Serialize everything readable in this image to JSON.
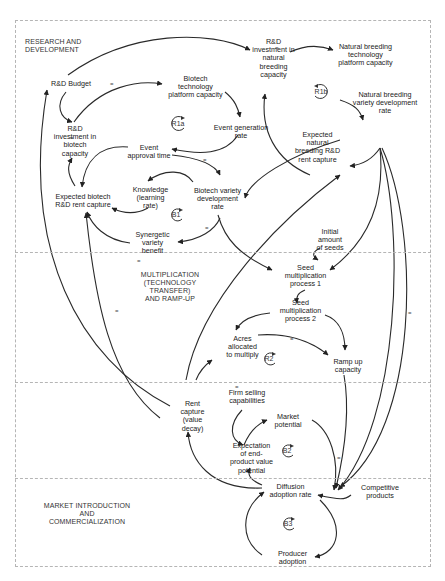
{
  "sections": [
    {
      "id": "rd",
      "label": "RESEARCH AND\nDEVELOPMENT"
    },
    {
      "id": "mult",
      "label": "MULTIPLICATION\n(TECHNOLOGY\nTRANSFER)\nAND RAMP-UP"
    },
    {
      "id": "market",
      "label": "MARKET INTRODUCTION\nAND\nCOMMERCIALIZATION"
    }
  ],
  "nodes": {
    "rd_budget": "R&D Budget",
    "rd_invest_biotech": "R&D\ninvestment in\nbiotech\ncapacity",
    "biotech_platform": "Biotech\ntechnology\nplatform capacity",
    "event_generation": "Event generation\nrate",
    "event_approval": "Event\napproval time",
    "knowledge": "Knowledge\n(learning\nrate)",
    "biotech_variety": "Biotech variety\ndevelopment\nrate",
    "expected_biotech": "Expected biotech\nR&D rent capture",
    "synergetic": "Synergetic\nvariety\nbenefit",
    "rd_invest_natural": "R&D\ninvestment in\nnatural\nbreeding\ncapacity",
    "natural_platform": "Natural breeding\ntechnology\nplatform capacity",
    "natural_variety": "Natural breeding\nvariety development\nrate",
    "expected_natural": "Expected\nnatural\nbreeding  R&D\nrent capture",
    "initial_seeds": "Initial\namount\nof seeds",
    "seed_mult_1": "Seed\nmultiplication\nprocess 1",
    "seed_mult_2": "Seed\nmultiplication\nprocess 2",
    "acres": "Acres\nallocated\nto multiply",
    "ramp_up": "Ramp up\ncapacity",
    "rent_capture": "Rent\ncapture\n(value\ndecay)",
    "firm_selling": "Firm selling\ncapabilities",
    "market_potential": "Market\npotential",
    "expectation_end": "Expectation\nof end-\nproduct value\npotential",
    "diffusion": "Diffusion\nadoption rate",
    "competitive": "Competitive\nproducts",
    "producer_adoption": "Producer\nadoption"
  },
  "loops": {
    "r1a": "R1a",
    "r1b": "R1b",
    "b1": "B1",
    "r2": "R2",
    "b2": "B2",
    "b3": "B3"
  },
  "polarity": {
    "plus": "+",
    "minus": "-",
    "delay": "="
  },
  "colors": {
    "line": "#222222",
    "border": "#b5b5b5",
    "text": "#222222"
  }
}
